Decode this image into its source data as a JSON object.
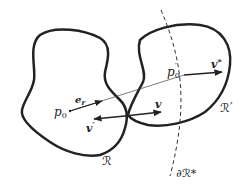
{
  "diagram": {
    "regions": [
      {
        "id": "R",
        "label": "ℛ"
      },
      {
        "id": "R_prime",
        "label": "ℛ′"
      }
    ],
    "boundary": {
      "label": "∂ℛ*"
    },
    "points": [
      {
        "id": "p0",
        "base": "p",
        "sub": "0",
        "prime": ""
      },
      {
        "id": "p0_prime",
        "base": "p",
        "sub": "0",
        "prime": "′"
      }
    ],
    "vectors": [
      {
        "id": "e_r",
        "base": "e",
        "sub": "r"
      },
      {
        "id": "v",
        "base": "v",
        "sup": ""
      },
      {
        "id": "v_prime",
        "base": "v",
        "sup": "′"
      },
      {
        "id": "v_star",
        "base": "v",
        "sup": "*"
      }
    ],
    "colors": {
      "stroke": "#222222",
      "background": "#ffffff"
    }
  }
}
